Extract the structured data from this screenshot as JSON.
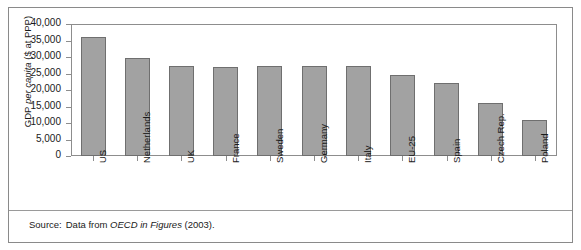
{
  "chart_data": {
    "type": "bar",
    "title": "",
    "subtitle": "",
    "xlabel": "",
    "ylabel": "GDP per capita ($ at PPP)",
    "ylabel_parts": {
      "pre": "GDP ",
      "italic": "per capita",
      "post": " ($ at PPP)"
    },
    "categories": [
      "US",
      "Netherlands",
      "UK",
      "France",
      "Sweden",
      "Germany",
      "Italy",
      "EU-25",
      "Spain",
      "Czech Rep.",
      "Poland"
    ],
    "values": [
      36000,
      29700,
      27400,
      27000,
      27200,
      27300,
      27400,
      24500,
      22000,
      16200,
      11000
    ],
    "ylim": [
      0,
      40000
    ],
    "ytick_values": [
      40000,
      35000,
      30000,
      25000,
      20000,
      15000,
      10000,
      5000,
      0
    ],
    "ytick_labels": [
      "40,000",
      "35,000",
      "30,000",
      "25,000",
      "20,000",
      "15,000",
      "10,000",
      "5,000",
      "0"
    ],
    "grid": false,
    "legend": null,
    "legend_position": "none",
    "bar_color": "#a2a2a2",
    "bar_edge_color": "#6f6f6f",
    "axis_color": "#8d8d8d",
    "text_color": "#1a1a1a",
    "background_color": "#ffffff"
  },
  "footer": {
    "source_prefix": "Source:",
    "source_text": "Data from",
    "source_italic": "OECD in Figures",
    "source_suffix": "(2003)."
  }
}
